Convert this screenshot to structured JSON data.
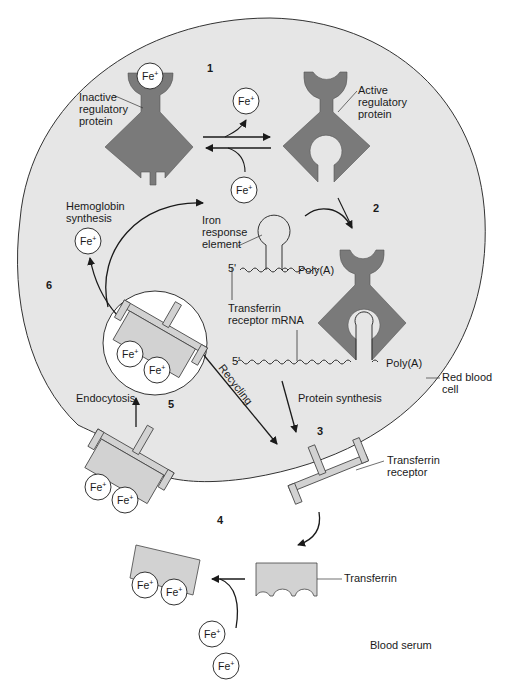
{
  "diagram": {
    "colors": {
      "cell_fill": "#e6e6e6",
      "cell_stroke": "#333333",
      "regulatory_protein": "#7a7a7a",
      "transferrin_fill": "#d2d2d2",
      "ion_fill": "#ffffff",
      "line": "#1a1a1a"
    },
    "step_numbers": [
      "1",
      "2",
      "3",
      "4",
      "5",
      "6"
    ],
    "labels": {
      "inactive_protein": [
        "Inactive",
        "regulatory",
        "protein"
      ],
      "active_protein": [
        "Active",
        "regulatory",
        "protein"
      ],
      "hemoglobin": [
        "Hemoglobin",
        "synthesis"
      ],
      "ire": [
        "Iron",
        "response",
        "element"
      ],
      "five_prime_1": "5'",
      "five_prime_2": "5'",
      "polya_1": "Poly(A)",
      "polya_2": "Poly(A)",
      "tfr_mrna": [
        "Transferrin",
        "receptor mRNA"
      ],
      "red_blood_cell": [
        "Red blood",
        "cell"
      ],
      "protein_synthesis": "Protein synthesis",
      "recycling": "Recycling",
      "endocytosis": "Endocytosis",
      "transferrin_receptor": [
        "Transferrin",
        "receptor"
      ],
      "transferrin": "Transferrin",
      "blood_serum": "Blood serum"
    },
    "ion": {
      "symbol": "Fe",
      "charge": "+"
    }
  }
}
